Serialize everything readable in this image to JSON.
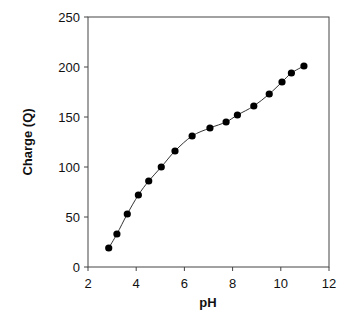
{
  "chart_data": {
    "type": "scatter",
    "title": "",
    "xlabel": "pH",
    "ylabel": "Charge (Q)",
    "xlim": [
      2,
      12
    ],
    "ylim": [
      0,
      250
    ],
    "xticks": [
      2,
      4,
      6,
      8,
      10,
      12
    ],
    "yticks": [
      0,
      50,
      100,
      150,
      200,
      250
    ],
    "grid": false,
    "legend": null,
    "series": [
      {
        "name": "Charge vs pH",
        "marker": "filled-circle",
        "line": "smooth-fit",
        "color": "#000000",
        "x": [
          2.86,
          3.2,
          3.63,
          4.09,
          4.52,
          5.04,
          5.61,
          6.32,
          7.06,
          7.73,
          8.2,
          8.88,
          9.52,
          10.05,
          10.44,
          10.96
        ],
        "y": [
          19,
          33,
          53,
          72,
          86,
          100,
          116,
          131,
          139,
          145,
          152,
          161,
          173,
          185,
          194,
          201
        ]
      }
    ]
  }
}
